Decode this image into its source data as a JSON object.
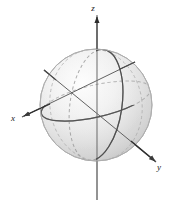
{
  "figure": {
    "background_color": "#ffffff",
    "width": 190,
    "height": 207
  },
  "axes": [
    {
      "name": "x-axis",
      "label": "x",
      "label_x": 13,
      "label_y": 121,
      "direction": "lower-left",
      "arrow": true,
      "color": "#3a3a3a",
      "start": {
        "x": 135,
        "y": 62
      },
      "end": {
        "x": 22,
        "y": 117
      }
    },
    {
      "name": "y-axis",
      "label": "y",
      "label_x": 159,
      "label_y": 170,
      "direction": "lower-right",
      "arrow": true,
      "color": "#3a3a3a",
      "start": {
        "x": 44,
        "y": 70
      },
      "end": {
        "x": 156,
        "y": 162
      }
    },
    {
      "name": "z-axis",
      "label": "z",
      "label_x": 93,
      "label_y": 11,
      "direction": "up",
      "arrow": true,
      "color": "#6a6a6a",
      "start": {
        "x": 97,
        "y": 200
      },
      "end": {
        "x": 97,
        "y": 15
      }
    }
  ],
  "sphere": {
    "name": "sphere",
    "center_x": 96,
    "center_y": 105,
    "radius": 56,
    "fill_light": "#fbfbfb",
    "fill_mid": "#e2e2e2",
    "fill_dark": "#c4c4c4",
    "outline_color": "#b9b9b9"
  },
  "great_circles": [
    {
      "name": "equator-circle",
      "style": "solid-front-dashed-back",
      "color": "#5d5d5d",
      "rx": 56,
      "ry": 16,
      "rotation": -13,
      "cy_offset": -4
    },
    {
      "name": "meridian-circle-front",
      "style": "solid-front-dashed-back",
      "color": "#5d5d5d",
      "rx": 26,
      "ry": 56,
      "rotation": 8
    },
    {
      "name": "meridian-circle-side",
      "style": "dashed-hidden",
      "color": "#8d8d8d",
      "rx": 46,
      "ry": 56,
      "rotation": -8
    }
  ]
}
